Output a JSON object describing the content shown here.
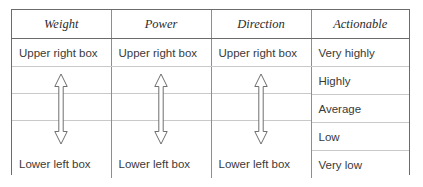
{
  "table": {
    "headers": [
      {
        "label": "Weight"
      },
      {
        "label": "Power"
      },
      {
        "label": "Direction"
      },
      {
        "label": "Actionable"
      }
    ],
    "rows": [
      {
        "cells": [
          "Upper right box",
          "Upper right box",
          "Upper right box",
          "Very highly"
        ]
      },
      {
        "cells": [
          "",
          "",
          "",
          "Highly"
        ]
      },
      {
        "cells": [
          "",
          "",
          "",
          "Average"
        ]
      },
      {
        "cells": [
          "",
          "",
          "",
          "Low"
        ]
      },
      {
        "cells": [
          "Lower left box",
          "Lower left box",
          "Lower left box",
          "Very low"
        ]
      }
    ],
    "arrows": [
      {
        "name": "double-headed-arrow-weight"
      },
      {
        "name": "double-headed-arrow-power"
      },
      {
        "name": "double-headed-arrow-direction"
      }
    ],
    "colors": {
      "outer_border": "#6b6b6b",
      "column_divider": "#8e8e8e",
      "row_rule": "#c9c9c9",
      "header_text": "#2b2b2b",
      "body_text": "#3a3a3a",
      "arrow_stroke": "#6e6e6e",
      "background": "#ffffff"
    }
  }
}
